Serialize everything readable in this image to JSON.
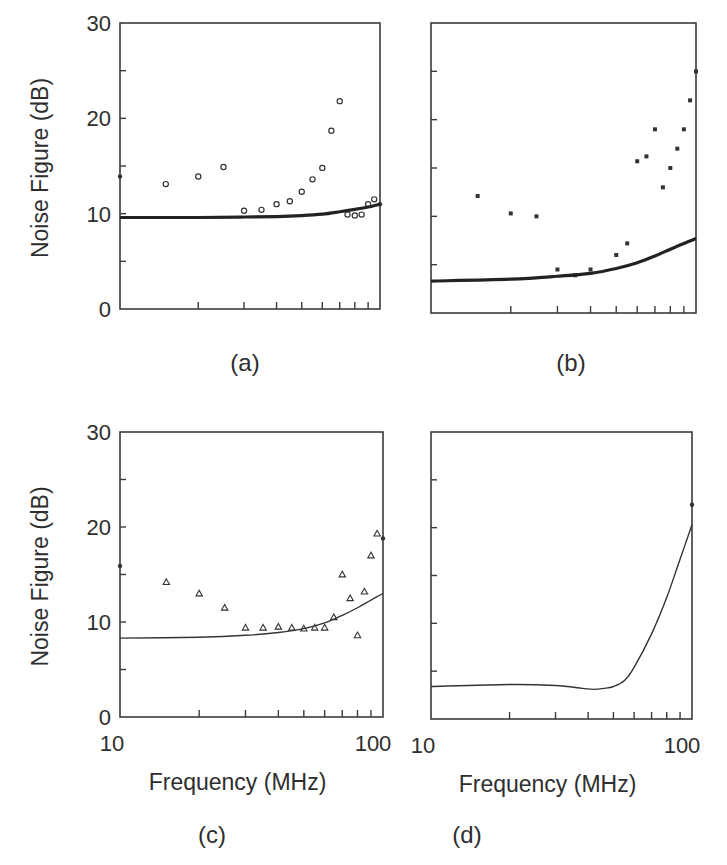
{
  "figure": {
    "y_axis_label": "Noise Figure (dB)",
    "x_axis_label": "Frequency (MHz)",
    "y_tick_labels": [
      "0",
      "10",
      "20",
      "30"
    ],
    "x_tick_labels": [
      "10",
      "100"
    ]
  },
  "chart_data": [
    {
      "panel": "(a)",
      "type": "scatter",
      "title": "",
      "xlabel": "",
      "ylabel": "Noise Figure (dB)",
      "x_scale": "log",
      "xlim": [
        10,
        100
      ],
      "ylim": [
        0,
        30
      ],
      "y_ticks": [
        0,
        10,
        20,
        30
      ],
      "y_minor_ticks": [
        5,
        15,
        25
      ],
      "x_minor_ticks": [
        20,
        30,
        40,
        50,
        60,
        70,
        80,
        90
      ],
      "show_y_tick_labels": true,
      "show_x_tick_labels": false,
      "grid": false,
      "series": [
        {
          "name": "measured",
          "marker": "open-circle",
          "x": [
            15,
            20,
            25,
            30,
            35,
            40,
            45,
            50,
            55,
            60,
            65,
            70,
            75,
            80,
            85,
            90,
            95
          ],
          "y": [
            13.1,
            13.9,
            14.9,
            10.3,
            10.4,
            11.0,
            11.3,
            12.3,
            13.6,
            14.8,
            18.7,
            21.8,
            9.9,
            9.8,
            9.9,
            11.0,
            11.5
          ]
        },
        {
          "name": "edge-markers",
          "marker": "dot",
          "x": [
            10,
            100
          ],
          "y": [
            13.9,
            11.0
          ]
        },
        {
          "name": "simulated",
          "line": "thick",
          "x": [
            10,
            20,
            30,
            40,
            50,
            60,
            70,
            80,
            90,
            100
          ],
          "y": [
            9.6,
            9.6,
            9.65,
            9.7,
            9.8,
            9.95,
            10.2,
            10.45,
            10.7,
            11.0
          ]
        }
      ]
    },
    {
      "panel": "(b)",
      "type": "scatter",
      "title": "",
      "xlabel": "",
      "ylabel": "",
      "x_scale": "log",
      "xlim": [
        10,
        100
      ],
      "ylim": [
        0,
        30
      ],
      "y_ticks": [
        0,
        10,
        20,
        30
      ],
      "y_minor_ticks": [
        5,
        15,
        25
      ],
      "x_minor_ticks": [
        20,
        30,
        40,
        50,
        60,
        70,
        80,
        90
      ],
      "show_y_tick_labels": false,
      "show_x_tick_labels": false,
      "grid": false,
      "series": [
        {
          "name": "measured",
          "marker": "filled-square",
          "x": [
            15,
            20,
            25,
            30,
            35,
            40,
            50,
            55,
            60,
            65,
            70,
            75,
            80,
            85,
            90,
            95,
            100
          ],
          "y": [
            12.1,
            10.3,
            10.0,
            4.5,
            3.9,
            4.5,
            6.0,
            7.2,
            15.7,
            16.2,
            19.0,
            13.0,
            15.0,
            17.0,
            19.0,
            22.0,
            25.0
          ]
        },
        {
          "name": "simulated",
          "line": "thick",
          "x": [
            10,
            20,
            30,
            40,
            50,
            60,
            70,
            80,
            90,
            100
          ],
          "y": [
            3.3,
            3.5,
            3.8,
            4.1,
            4.6,
            5.2,
            5.9,
            6.6,
            7.2,
            7.7
          ]
        }
      ]
    },
    {
      "panel": "(c)",
      "type": "scatter",
      "title": "",
      "xlabel": "Frequency (MHz)",
      "ylabel": "Noise Figure (dB)",
      "x_scale": "log",
      "xlim": [
        10,
        100
      ],
      "ylim": [
        0,
        30
      ],
      "y_ticks": [
        0,
        10,
        20,
        30
      ],
      "y_minor_ticks": [
        5,
        15,
        25
      ],
      "x_ticks": [
        10,
        100
      ],
      "x_minor_ticks": [
        20,
        30,
        40,
        50,
        60,
        70,
        80,
        90
      ],
      "show_y_tick_labels": true,
      "show_x_tick_labels": true,
      "grid": false,
      "series": [
        {
          "name": "measured",
          "marker": "open-triangle",
          "x": [
            15,
            20,
            25,
            30,
            35,
            40,
            45,
            50,
            55,
            60,
            65,
            70,
            75,
            80,
            85,
            90,
            95
          ],
          "y": [
            14.2,
            13.0,
            11.5,
            9.4,
            9.4,
            9.5,
            9.4,
            9.3,
            9.4,
            9.4,
            10.5,
            15.0,
            12.5,
            8.6,
            13.2,
            17.0,
            19.3
          ]
        },
        {
          "name": "edge-markers",
          "marker": "dot",
          "x": [
            10,
            100
          ],
          "y": [
            15.9,
            18.8
          ]
        },
        {
          "name": "simulated",
          "line": "thin",
          "x": [
            10,
            20,
            30,
            40,
            50,
            60,
            70,
            80,
            90,
            100
          ],
          "y": [
            8.3,
            8.4,
            8.6,
            8.9,
            9.3,
            9.9,
            10.7,
            11.5,
            12.3,
            13.0
          ]
        }
      ]
    },
    {
      "panel": "(d)",
      "type": "line",
      "title": "",
      "xlabel": "Frequency (MHz)",
      "ylabel": "",
      "x_scale": "log",
      "xlim": [
        10,
        100
      ],
      "ylim": [
        0,
        30
      ],
      "y_ticks": [
        0,
        10,
        20,
        30
      ],
      "y_minor_ticks": [
        5,
        15,
        25
      ],
      "x_ticks": [
        10,
        100
      ],
      "x_minor_ticks": [
        20,
        30,
        40,
        50,
        60,
        70,
        80,
        90
      ],
      "show_y_tick_labels": false,
      "show_x_tick_labels": true,
      "grid": false,
      "series": [
        {
          "name": "simulated",
          "line": "thin",
          "x": [
            10,
            20,
            30,
            38,
            42,
            46,
            50,
            55,
            60,
            70,
            80,
            90,
            100
          ],
          "y": [
            3.4,
            3.6,
            3.5,
            3.2,
            3.1,
            3.2,
            3.4,
            4.0,
            5.4,
            8.9,
            12.7,
            16.7,
            20.3
          ]
        },
        {
          "name": "edge-markers",
          "marker": "dot",
          "x": [
            100
          ],
          "y": [
            22.4
          ]
        }
      ]
    }
  ],
  "layout": {
    "panels": [
      {
        "left": 120,
        "right": 380,
        "top": 23,
        "bottom": 309,
        "label_x": 245,
        "label_y": 371
      },
      {
        "left": 431,
        "right": 696,
        "top": 23,
        "bottom": 313,
        "label_x": 571,
        "label_y": 371
      },
      {
        "left": 120,
        "right": 383,
        "top": 432,
        "bottom": 717,
        "label_x": 212,
        "label_y": 843
      },
      {
        "left": 431,
        "right": 692,
        "top": 432,
        "bottom": 719,
        "label_x": 467,
        "label_y": 843
      }
    ]
  }
}
